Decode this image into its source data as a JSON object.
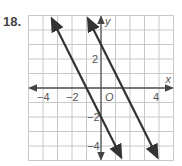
{
  "problem_number": "18.",
  "graph": {
    "x_label": "x",
    "y_label": "y",
    "origin_label": "O",
    "x_ticks": [
      {
        "v": -4,
        "label": "−4"
      },
      {
        "v": -2,
        "label": "−2"
      },
      {
        "v": 4,
        "label": "4"
      }
    ],
    "y_ticks": [
      {
        "v": 2,
        "label": "2"
      },
      {
        "v": -2,
        "label": "−2"
      },
      {
        "v": -4,
        "label": "−4"
      }
    ],
    "xlim": [
      -5,
      5
    ],
    "ylim": [
      -5,
      5
    ],
    "lines": [
      {
        "name": "line-1",
        "slope": -2,
        "intercept": -2
      },
      {
        "name": "line-2",
        "slope": -2,
        "intercept": 3
      }
    ],
    "colors": {
      "grid": "#c8c8c8",
      "axis": "#555555",
      "line": "#333333"
    }
  }
}
